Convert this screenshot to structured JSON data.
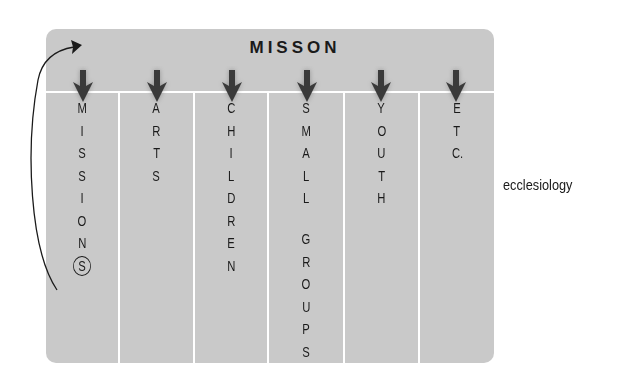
{
  "diagram": {
    "title": "MISSON",
    "side_label": "ecclesiology",
    "colors": {
      "panel": "#c9c9c9",
      "divider": "#ffffff",
      "text": "#1a1a1a",
      "arrow": "#3a3a3a"
    },
    "columns": [
      {
        "label": "MISSIONS",
        "letters": [
          "M",
          "I",
          "S",
          "S",
          "I",
          "O",
          "N",
          "S"
        ],
        "circled_last": true
      },
      {
        "label": "ARTS",
        "letters": [
          "A",
          "R",
          "T",
          "S"
        ]
      },
      {
        "label": "CHILDREN",
        "letters": [
          "C",
          "H",
          "I",
          "L",
          "D",
          "R",
          "E",
          "N"
        ]
      },
      {
        "label": "SMALL GROUPS",
        "letters": [
          "S",
          "M",
          "A",
          "L",
          "L",
          "",
          "G",
          "R",
          "O",
          "U",
          "P",
          "S"
        ]
      },
      {
        "label": "YOUTH",
        "letters": [
          "Y",
          "O",
          "U",
          "T",
          "H"
        ]
      },
      {
        "label": "ETC.",
        "letters": [
          "E",
          "T",
          "C."
        ]
      }
    ],
    "loop_arrow": "from circled S in MISSIONS back up to MISSON header"
  }
}
